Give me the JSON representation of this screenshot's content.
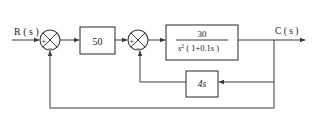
{
  "diagram": {
    "type": "control-system-block-diagram",
    "input_label": "R ( s )",
    "output_label": "C ( s )",
    "summing_junction_1": {
      "signs": [
        "+",
        "−"
      ]
    },
    "summing_junction_2": {
      "signs": [
        "+",
        "−"
      ]
    },
    "blocks": {
      "gain": {
        "text": "50"
      },
      "plant": {
        "numerator": "30",
        "denominator_base": "s",
        "denominator_exp": "2",
        "denominator_rest": " ( 1+0.1s )"
      },
      "feedback": {
        "text": "4s"
      }
    },
    "signal_flow": [
      "R(s) -> sum1(+)",
      "sum1 -> 50",
      "50 -> sum2(+)",
      "sum2 -> 30/(s^2(1+0.1s))",
      "30/(s^2(1+0.1s)) -> C(s)",
      "C(s) -> 4s -> sum2(-)",
      "C(s) -> sum1(-) (unity feedback)"
    ]
  },
  "colors": {
    "line": "#3a3a3a",
    "text": "#222222",
    "background": "#ffffff"
  }
}
